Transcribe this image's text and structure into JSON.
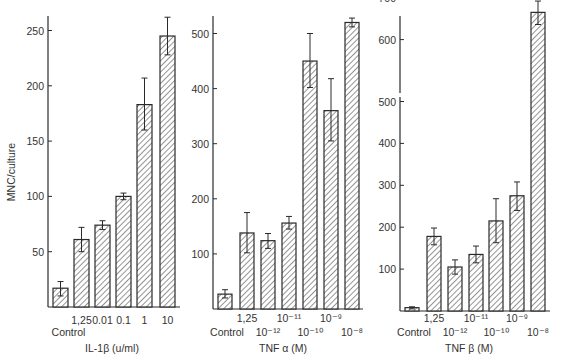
{
  "colors": {
    "ink": "#2a2a2a",
    "hatch": "#3a3a3a",
    "background": "#ffffff"
  },
  "chart_data": [
    {
      "type": "bar",
      "panel": "left",
      "title": "",
      "ylabel": "MNC/culture",
      "xlabel": "IL-1β (u/ml)",
      "ylim": [
        0,
        270
      ],
      "yticks": [
        50,
        100,
        150,
        200,
        250
      ],
      "grid": false,
      "bar_fill": "diagonal hatch",
      "categories": [
        "Control",
        "1,25",
        "0.01",
        "0.1",
        "1",
        "10"
      ],
      "label_rows": [
        1,
        0,
        0,
        0,
        0,
        0
      ],
      "values": [
        17,
        61,
        74,
        100,
        183,
        245
      ],
      "error_low": [
        10,
        50,
        70,
        97,
        160,
        228
      ],
      "error_high": [
        23,
        72,
        78,
        103,
        207,
        262
      ]
    },
    {
      "type": "bar",
      "panel": "middle",
      "title": "",
      "ylabel": "",
      "xlabel": "TNF α (M)",
      "ylim": [
        0,
        540
      ],
      "yticks": [
        100,
        200,
        300,
        400,
        500
      ],
      "grid": false,
      "bar_fill": "diagonal hatch",
      "categories": [
        "Control",
        "1,25",
        "10⁻¹²",
        "10⁻¹¹",
        "10⁻¹⁰",
        "10⁻⁹",
        "10⁻⁸"
      ],
      "label_rows": [
        1,
        0,
        1,
        0,
        1,
        0,
        1
      ],
      "values": [
        27,
        138,
        124,
        156,
        450,
        360,
        520
      ],
      "error_low": [
        20,
        102,
        110,
        145,
        402,
        305,
        512
      ],
      "error_high": [
        35,
        175,
        137,
        168,
        500,
        418,
        528
      ]
    },
    {
      "type": "bar",
      "panel": "right",
      "title": "",
      "ylabel": "",
      "xlabel": "TNF β (M)",
      "ylim": [
        0,
        700
      ],
      "yticks": [
        100,
        200,
        300,
        400,
        500,
        600,
        700
      ],
      "axis_break_between": [
        500,
        600
      ],
      "grid": false,
      "bar_fill": "diagonal hatch",
      "categories": [
        "Control",
        "1,25",
        "10⁻¹²",
        "10⁻¹¹",
        "10⁻¹⁰",
        "10⁻⁹",
        "10⁻⁸"
      ],
      "label_rows": [
        1,
        0,
        1,
        0,
        1,
        0,
        1
      ],
      "values": [
        8,
        178,
        105,
        135,
        215,
        275,
        665
      ],
      "error_low": [
        5,
        158,
        88,
        115,
        163,
        240,
        636
      ],
      "error_high": [
        10,
        198,
        122,
        155,
        268,
        308,
        692
      ]
    }
  ],
  "layout": {
    "panels": [
      {
        "axis_x": 48,
        "axis_top": 16,
        "axis_right": 180,
        "baseline": 307,
        "px_per_unit": 1.106,
        "bar_x": [
          53,
          74,
          95,
          116,
          137,
          160
        ],
        "bar_w": 15,
        "label_y": [
          324,
          336
        ],
        "xlabel_y": 352,
        "xlabel_x": 112
      },
      {
        "axis_x": 213,
        "axis_top": 16,
        "axis_right": 363,
        "baseline": 309,
        "px_per_unit": 0.551,
        "bar_x": [
          218,
          240,
          261,
          282,
          303,
          324,
          345
        ],
        "bar_w": 14,
        "label_y": [
          322,
          336
        ],
        "xlabel_y": 352,
        "xlabel_x": 283
      },
      {
        "axis_x": 400,
        "axis_top": 16,
        "axis_right": 550,
        "baseline": 311,
        "px_per_unit": 0.419,
        "upper_offset": -20,
        "break_y": 96,
        "bar_x": [
          405,
          427,
          448,
          469,
          489,
          510,
          531
        ],
        "bar_w": 14,
        "label_y": [
          322,
          336
        ],
        "xlabel_y": 352,
        "xlabel_x": 469
      }
    ]
  }
}
